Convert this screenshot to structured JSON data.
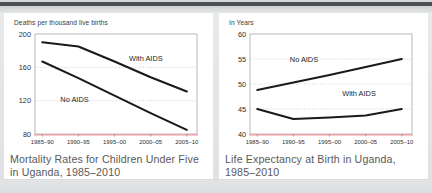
{
  "page": {
    "background_color": "#e3e5e6",
    "panel_color": "#ffffff",
    "top_bar_color": "#4b5054",
    "line_color": "#1a1a1a",
    "grid_color": "#a8a8a8",
    "axis_highlight_color": "#f2959e"
  },
  "chart_data": [
    {
      "type": "line",
      "id": "child-mortality-uganda",
      "title": "",
      "ylabel": "Deaths per thousand live births",
      "xlabel": "",
      "caption": "Mortality Rates for Children Under Five in Uganda, 1985–2010",
      "categories": [
        "1985–90",
        "1990–95",
        "1995–00",
        "2000–05",
        "2005–10"
      ],
      "ylim": [
        80,
        200
      ],
      "yticks": [
        80,
        120,
        160,
        200
      ],
      "gridlines": [
        120,
        160
      ],
      "grid": true,
      "legend": "inline-annotations",
      "series": [
        {
          "name": "With AIDS",
          "values": [
            190,
            185,
            167,
            148,
            131
          ]
        },
        {
          "name": "No AIDS",
          "values": [
            167,
            147,
            126,
            105,
            85
          ]
        }
      ],
      "annotations": [
        {
          "text": "With AIDS",
          "x_index": 2.4,
          "y": 168
        },
        {
          "text": "No AIDS",
          "x_index": 0.5,
          "y": 118
        }
      ]
    },
    {
      "type": "line",
      "id": "life-expectancy-uganda",
      "title": "",
      "ylabel": "In Years",
      "xlabel": "",
      "caption": "Life Expectancy at Birth in Uganda, 1985–2010",
      "categories": [
        "1985–90",
        "1990–95",
        "1995–00",
        "2000–05",
        "2005–10"
      ],
      "ylim": [
        40,
        60
      ],
      "yticks": [
        40,
        45,
        50,
        55,
        60
      ],
      "gridlines": [
        45,
        50,
        55
      ],
      "grid": true,
      "legend": "inline-annotations",
      "series": [
        {
          "name": "No AIDS",
          "values": [
            48.8,
            50.3,
            51.8,
            53.4,
            55.0
          ]
        },
        {
          "name": "With AIDS",
          "values": [
            45.0,
            43.0,
            43.3,
            43.7,
            45.0
          ]
        }
      ],
      "annotations": [
        {
          "text": "No AIDS",
          "x_index": 0.9,
          "y": 54.4
        },
        {
          "text": "With AIDS",
          "x_index": 2.35,
          "y": 47.6
        }
      ]
    }
  ]
}
